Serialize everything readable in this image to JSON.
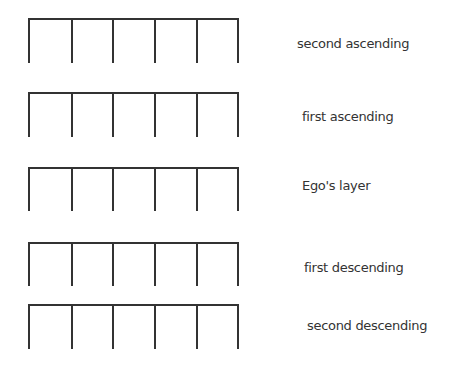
{
  "diagram": {
    "stroke_color": "#333333",
    "text_color": "#333333",
    "slots_per_layer": 5,
    "layers": [
      {
        "label": "second ascending",
        "top": 19,
        "height": 45,
        "label_x": 297,
        "label_y": 36
      },
      {
        "label": "first ascending",
        "top": 93,
        "height": 45,
        "label_x": 302,
        "label_y": 109
      },
      {
        "label": "Ego's layer",
        "top": 168,
        "height": 44,
        "label_x": 302,
        "label_y": 178
      },
      {
        "label": "first descending",
        "top": 243,
        "height": 44,
        "label_x": 304,
        "label_y": 260
      },
      {
        "label": "second descending",
        "top": 305,
        "height": 45,
        "label_x": 307,
        "label_y": 318
      }
    ]
  }
}
